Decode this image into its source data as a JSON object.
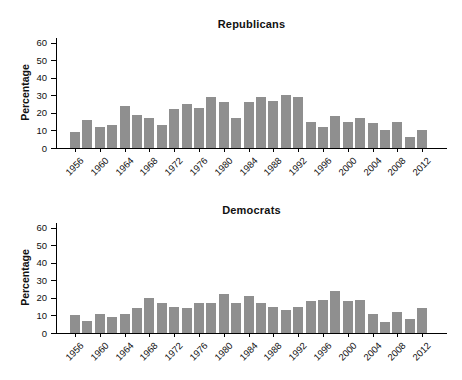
{
  "chart_data": [
    {
      "type": "bar",
      "title": "Republicans",
      "ylabel": "Percentage",
      "xlabel": "",
      "ylim": [
        0,
        60
      ],
      "grid": false,
      "legend": null,
      "bar_color": "#8f8f8f",
      "yticks": [
        0,
        10,
        20,
        30,
        40,
        50,
        60
      ],
      "x": [
        1956,
        1958,
        1960,
        1962,
        1964,
        1966,
        1968,
        1970,
        1972,
        1974,
        1976,
        1978,
        1980,
        1982,
        1984,
        1986,
        1988,
        1990,
        1992,
        1994,
        1996,
        1998,
        2000,
        2002,
        2004,
        2006,
        2008,
        2010,
        2012
      ],
      "values": [
        9,
        16,
        12,
        13,
        24,
        19,
        17,
        13,
        22,
        25,
        23,
        29,
        26,
        17,
        26,
        29,
        27,
        30,
        29,
        15,
        12,
        18,
        15,
        17,
        14,
        10,
        15,
        6,
        10
      ],
      "xtick_labels": [
        "1956",
        "1960",
        "1964",
        "1968",
        "1972",
        "1976",
        "1980",
        "1984",
        "1988",
        "1992",
        "1996",
        "2000",
        "2004",
        "2008",
        "2012"
      ]
    },
    {
      "type": "bar",
      "title": "Democrats",
      "ylabel": "Percentage",
      "xlabel": "",
      "ylim": [
        0,
        60
      ],
      "grid": false,
      "legend": null,
      "bar_color": "#8f8f8f",
      "yticks": [
        0,
        10,
        20,
        30,
        40,
        50,
        60
      ],
      "x": [
        1956,
        1958,
        1960,
        1962,
        1964,
        1966,
        1968,
        1970,
        1972,
        1974,
        1976,
        1978,
        1980,
        1982,
        1984,
        1986,
        1988,
        1990,
        1992,
        1994,
        1996,
        1998,
        2000,
        2002,
        2004,
        2006,
        2008,
        2010,
        2012
      ],
      "values": [
        10,
        7,
        11,
        9,
        11,
        14,
        20,
        17,
        15,
        14,
        17,
        17,
        22,
        17,
        21,
        17,
        15,
        13,
        15,
        18,
        19,
        24,
        18,
        19,
        11,
        6,
        12,
        8,
        14
      ],
      "xtick_labels": [
        "1956",
        "1960",
        "1964",
        "1968",
        "1972",
        "1976",
        "1980",
        "1984",
        "1988",
        "1992",
        "1996",
        "2000",
        "2004",
        "2008",
        "2012"
      ]
    }
  ]
}
